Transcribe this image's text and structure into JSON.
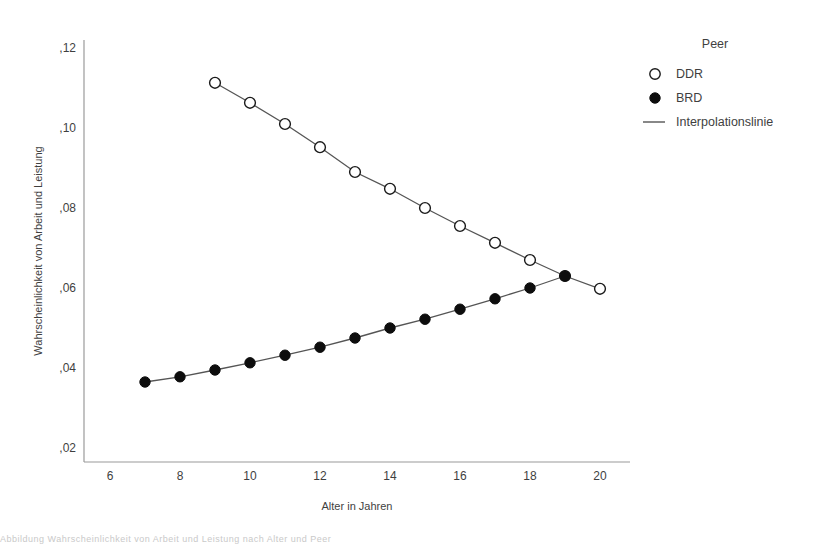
{
  "chart_data": {
    "type": "line",
    "title": "",
    "xlabel": "Alter in Jahren",
    "ylabel": "Wahrscheinlichkeit von Arbeit und Leistung",
    "xlim": [
      5,
      21
    ],
    "ylim": [
      0.02,
      0.125
    ],
    "grid": false,
    "legend_position": "top-right",
    "legend_title": "Peer",
    "x_ticks": [
      "6",
      "8",
      "10",
      "12",
      "14",
      "16",
      "18",
      "20"
    ],
    "x_tick_values": [
      6,
      8,
      10,
      12,
      14,
      16,
      18,
      20
    ],
    "y_ticks": [
      ",02",
      ",04",
      ",06",
      ",08",
      ",10",
      ",12"
    ],
    "y_tick_values": [
      0.02,
      0.04,
      0.06,
      0.08,
      0.1,
      0.12
    ],
    "series": [
      {
        "name": "DDR",
        "marker": "open-circle",
        "x": [
          9,
          10,
          11,
          12,
          13,
          14,
          15,
          16,
          17,
          18,
          19,
          20
        ],
        "values": [
          0.1113,
          0.1063,
          0.101,
          0.0952,
          0.089,
          0.0848,
          0.08,
          0.0755,
          0.0713,
          0.067,
          0.063,
          0.0598
        ]
      },
      {
        "name": "BRD",
        "marker": "filled-circle",
        "x": [
          7,
          8,
          9,
          10,
          11,
          12,
          13,
          14,
          15,
          16,
          17,
          18,
          19
        ],
        "values": [
          0.0365,
          0.0378,
          0.0395,
          0.0413,
          0.0432,
          0.0452,
          0.0475,
          0.05,
          0.0522,
          0.0547,
          0.0573,
          0.06,
          0.063
        ]
      }
    ],
    "legend_entries": [
      {
        "label": "DDR",
        "marker": "open-circle"
      },
      {
        "label": "BRD",
        "marker": "filled-circle"
      },
      {
        "label": "Interpolationslinie",
        "marker": "line"
      }
    ]
  },
  "colors": {
    "axis": "#9a9a9a",
    "marker_stroke": "#1a1a1a",
    "marker_fill": "#0d0d0d",
    "line": "#555555",
    "text": "#3f3f3f",
    "background": "#ffffff"
  },
  "footer": {
    "caption": "Abbildung Wahrscheinlichkeit von Arbeit und Leistung nach Alter und Peer"
  }
}
